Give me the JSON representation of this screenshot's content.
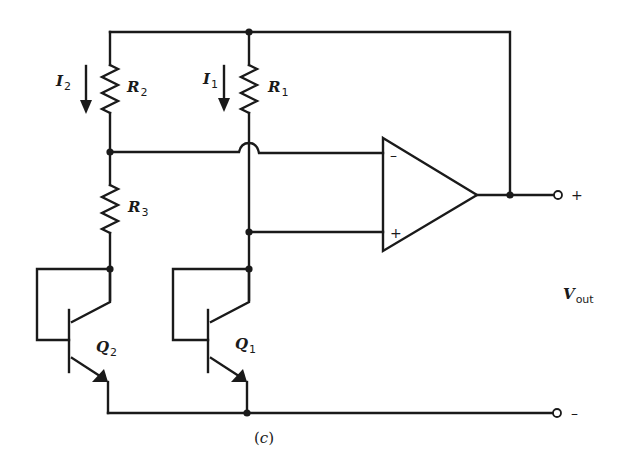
{
  "figure": {
    "caption_open": "(",
    "caption_letter": "c",
    "caption_close": ")"
  },
  "labels": {
    "I2": {
      "main": "I",
      "sub": "2"
    },
    "I1": {
      "main": "I",
      "sub": "1"
    },
    "R2": {
      "main": "R",
      "sub": "2"
    },
    "R1": {
      "main": "R",
      "sub": "1"
    },
    "R3": {
      "main": "R",
      "sub": "3"
    },
    "Q2": {
      "main": "Q",
      "sub": "2"
    },
    "Q1": {
      "main": "Q",
      "sub": "1"
    },
    "Vout": {
      "main": "V",
      "sub": "out"
    }
  },
  "opamp": {
    "inverting_sign": "–",
    "noninverting_sign": "+"
  },
  "terminals": {
    "positive_sign": "+",
    "negative_sign": "–"
  },
  "colors": {
    "ink": "#1a1a1a",
    "background": "#ffffff"
  }
}
